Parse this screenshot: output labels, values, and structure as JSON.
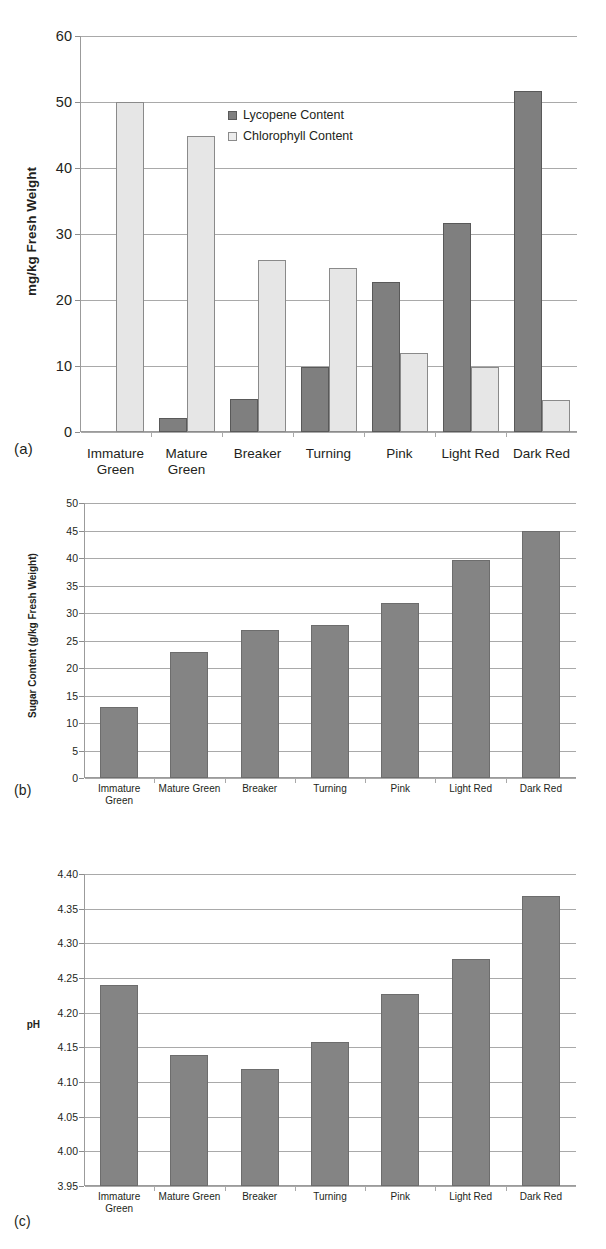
{
  "figure": {
    "panels": [
      {
        "tag": "(a)"
      },
      {
        "tag": "(b)"
      },
      {
        "tag": "(c)"
      }
    ]
  },
  "chart_data": [
    {
      "type": "bar",
      "panel": "(a)",
      "title": "",
      "xlabel": "",
      "ylabel": "mg/kg  Fresh Weight",
      "ylim": [
        0,
        60
      ],
      "yticks": [
        0,
        10,
        20,
        30,
        40,
        50,
        60
      ],
      "ytick_labels": [
        "0",
        "10",
        "20",
        "30",
        "40",
        "50",
        "60"
      ],
      "grid": true,
      "legend": {
        "position": "inside-top-center",
        "entries": [
          "Lycopene Content",
          "Chlorophyll Content"
        ]
      },
      "categories": [
        "Immature Green",
        "Mature Green",
        "Breaker",
        "Turning",
        "Pink",
        "Light Red",
        "Dark Red"
      ],
      "series": [
        {
          "name": "Lycopene Content",
          "color": "#7f7f7f",
          "values": [
            0,
            2.1,
            5.0,
            9.9,
            22.7,
            31.7,
            51.7
          ]
        },
        {
          "name": "Chlorophyll Content",
          "color": "#e6e6e6",
          "values": [
            50.0,
            44.9,
            26.0,
            24.9,
            11.9,
            9.8,
            4.8
          ]
        }
      ]
    },
    {
      "type": "bar",
      "panel": "(b)",
      "title": "",
      "xlabel": "",
      "ylabel": "Sugar Content (g/kg Fresh Weight)",
      "ylim": [
        0,
        50
      ],
      "yticks": [
        0,
        5,
        10,
        15,
        20,
        25,
        30,
        35,
        40,
        45,
        50
      ],
      "ytick_labels": [
        "0",
        "5",
        "10",
        "15",
        "20",
        "25",
        "30",
        "35",
        "40",
        "45",
        "50"
      ],
      "grid": true,
      "legend": null,
      "categories": [
        "Immature Green",
        "Mature Green",
        "Breaker",
        "Turning",
        "Pink",
        "Light Red",
        "Dark Red"
      ],
      "series": [
        {
          "name": "Sugar Content",
          "color": "#848484",
          "values": [
            13.0,
            22.9,
            26.9,
            27.8,
            31.8,
            39.7,
            44.9
          ]
        }
      ]
    },
    {
      "type": "bar",
      "panel": "(c)",
      "title": "",
      "xlabel": "",
      "ylabel": "pH",
      "ylim": [
        3.95,
        4.4
      ],
      "yticks": [
        3.95,
        4.0,
        4.05,
        4.1,
        4.15,
        4.2,
        4.25,
        4.3,
        4.35,
        4.4
      ],
      "ytick_labels": [
        "3.95",
        "4.00",
        "4.05",
        "4.10",
        "4.15",
        "4.20",
        "4.25",
        "4.30",
        "4.35",
        "4.40"
      ],
      "grid": true,
      "legend": null,
      "categories": [
        "Immature Green",
        "Mature Green",
        "Breaker",
        "Turning",
        "Pink",
        "Light Red",
        "Dark Red"
      ],
      "series": [
        {
          "name": "pH",
          "color": "#848484",
          "values": [
            4.24,
            4.139,
            4.119,
            4.158,
            4.227,
            4.278,
            4.368
          ]
        }
      ]
    }
  ],
  "panel_a": {
    "tag": "(a)",
    "ylabel": "mg/kg  Fresh Weight",
    "legend": {
      "lycopene": "Lycopene Content",
      "chlorophyll": "Chlorophyll Content"
    },
    "xlabels": [
      "Immature\nGreen",
      "Mature\nGreen",
      "Breaker",
      "Turning",
      "Pink",
      "Light Red",
      "Dark Red"
    ],
    "yticks": [
      "0",
      "10",
      "20",
      "30",
      "40",
      "50",
      "60"
    ]
  },
  "panel_b": {
    "tag": "(b)",
    "ylabel": "Sugar Content (g/kg Fresh Weight)",
    "xlabels": [
      "Immature\nGreen",
      "Mature Green",
      "Breaker",
      "Turning",
      "Pink",
      "Light Red",
      "Dark Red"
    ],
    "yticks": [
      "0",
      "5",
      "10",
      "15",
      "20",
      "25",
      "30",
      "35",
      "40",
      "45",
      "50"
    ]
  },
  "panel_c": {
    "tag": "(c)",
    "ylabel": "pH",
    "xlabels": [
      "Immature\nGreen",
      "Mature Green",
      "Breaker",
      "Turning",
      "Pink",
      "Light Red",
      "Dark Red"
    ],
    "yticks": [
      "3.95",
      "4.00",
      "4.05",
      "4.10",
      "4.15",
      "4.20",
      "4.25",
      "4.30",
      "4.35",
      "4.40"
    ]
  }
}
